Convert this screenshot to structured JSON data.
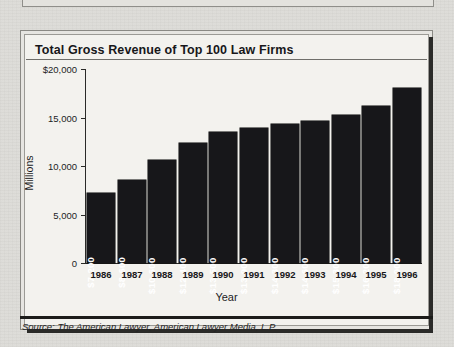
{
  "figure": {
    "title": "Total Gross Revenue of Top 100 Law Firms",
    "source": "Source: The American Lawyer, American Lawyer Media, L.P."
  },
  "colors": {
    "bar": "#17171a",
    "page_background": "#dcdbd7",
    "panel_background": "#f3f2ee",
    "axis": "#2a2a28",
    "value_label": "#ffffff"
  },
  "chart_data": {
    "type": "bar",
    "title": "Total Gross Revenue of Top 100 Law Firms",
    "xlabel": "Year",
    "ylabel": "Millions",
    "categories": [
      "1986",
      "1987",
      "1988",
      "1989",
      "1990",
      "1991",
      "1992",
      "1993",
      "1994",
      "1995",
      "1996"
    ],
    "values": [
      7200,
      8600,
      10600,
      12400,
      13500,
      13900,
      14300,
      14600,
      15300,
      16200,
      18000
    ],
    "value_labels": [
      "$7,200",
      "$8,600",
      "$10,600",
      "$12,400",
      "$13,500",
      "$13,900",
      "$14,300",
      "$14,600",
      "$15,300",
      "$16,200",
      "$18,000"
    ],
    "ylim": [
      0,
      20000
    ],
    "yticks": [
      0,
      5000,
      10000,
      15000,
      20000
    ],
    "ytick_labels": [
      "0",
      "5,000",
      "10,000",
      "15,000",
      "$20,000"
    ],
    "grid": false,
    "legend": false
  }
}
